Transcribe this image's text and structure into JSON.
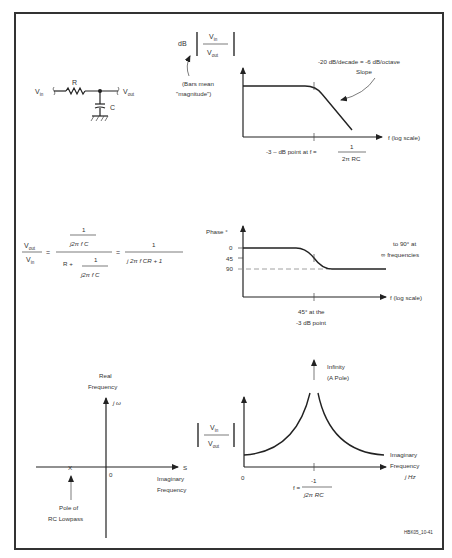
{
  "figure_id": "HBK05_10-41",
  "circuit": {
    "vin": "V",
    "vin_sub": "in",
    "vout": "V",
    "vout_sub": "out",
    "resistor": "R",
    "capacitor": "C"
  },
  "magnitude_plot": {
    "ylabel_prefix": "dB",
    "ratio_num": "V",
    "ratio_num_sub": "in",
    "ratio_den": "V",
    "ratio_den_sub": "out",
    "bars_note_line1": "(Bars mean",
    "bars_note_line2": "\"magnitude\")",
    "slope_line1": "-20 dB/decade = -6 dB/octave",
    "slope_line2": "Slope",
    "xlabel": "f (log scale)",
    "corner_label": "-3 – dB point at f =",
    "corner_num": "1",
    "corner_den": "2π RC"
  },
  "transfer_equation": {
    "lhs_num": "V",
    "lhs_num_sub": "out",
    "lhs_den": "V",
    "lhs_den_sub": "in",
    "eq": "=",
    "mid_num_top": "1",
    "mid_num_bottom": "j2π f C",
    "mid_den_prefix": "R +",
    "mid_den_num": "1",
    "mid_den_den": "j2π f C",
    "eq2": "=",
    "rhs_num": "1",
    "rhs_den": "j  2π f CR + 1"
  },
  "phase_plot": {
    "ylabel": "Phase °",
    "ticks": [
      "0",
      "45",
      "90"
    ],
    "note_line1": "to 90° at",
    "note_line2": "∞ frequencies",
    "xlabel": "f (log scale)",
    "corner_line1": "45° at the",
    "corner_line2": "-3 dB point"
  },
  "s_plane": {
    "title_line1": "Real",
    "title_line2": "Frequency",
    "yaxis": "j ω",
    "xaxis": "S",
    "origin": "0",
    "xlabel_line1": "Imaginary",
    "xlabel_line2": "Frequency",
    "pole_marker": "X",
    "pole_line1": "Pole of",
    "pole_line2": "RC Lowpass"
  },
  "pole_plot": {
    "ratio_num": "V",
    "ratio_num_sub": "in",
    "ratio_den": "V",
    "ratio_den_sub": "out",
    "infinity_line1": "Infinity",
    "infinity_line2": "(A Pole)",
    "origin": "0",
    "xlabel_line1": "Imaginary",
    "xlabel_line2": "Frequency",
    "xlabel_line3": "j Hz",
    "pole_label": "f =",
    "pole_num": "-1",
    "pole_den": "j2π RC"
  }
}
